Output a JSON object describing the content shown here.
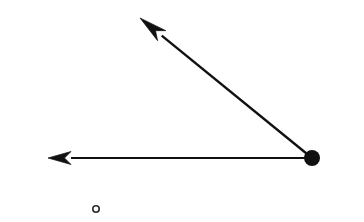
{
  "figure": {
    "title": "Angle formed by two rays",
    "width": 364,
    "height": 222,
    "background_color": "#ffffff",
    "stroke_color": "#111111",
    "fill_color": "#111111"
  },
  "chart_data": {
    "type": "diagram",
    "title": "Angle formed by two rays",
    "xlabel": "",
    "ylabel": "",
    "xlim": [
      0,
      364
    ],
    "ylim": [
      0,
      222
    ],
    "grid": false,
    "legend": "none",
    "axis_visible": false,
    "measured_angle_degrees": 28,
    "points": [
      {
        "name": "vertex",
        "label": "",
        "x": 312,
        "y": 158,
        "marker": "filled-circle",
        "radius": 8,
        "color": "#111111"
      },
      {
        "name": "horizontal-ray-tip",
        "label": "",
        "x": 48,
        "y": 158,
        "marker": "arrow-tip",
        "color": "#111111"
      },
      {
        "name": "diagonal-ray-tip",
        "label": "",
        "x": 140,
        "y": 18,
        "marker": "arrow-tip",
        "color": "#111111"
      },
      {
        "name": "open-circle-mark",
        "label": "",
        "x": 96,
        "y": 209,
        "marker": "open-circle",
        "radius": 4,
        "stroke_width": 1.6,
        "color": "#2b2b2b"
      }
    ],
    "series": [
      {
        "name": "horizontal-ray",
        "from": [
          312,
          158
        ],
        "to": [
          48,
          158
        ],
        "arrow": "end",
        "stroke_width": 2.2,
        "length": 264,
        "angle_degrees": 180
      },
      {
        "name": "diagonal-ray",
        "from": [
          312,
          158
        ],
        "to": [
          140,
          18
        ],
        "arrow": "end",
        "stroke_width": 2.4,
        "length": 221.8,
        "angle_degrees": 140.9
      }
    ],
    "annotations": []
  }
}
